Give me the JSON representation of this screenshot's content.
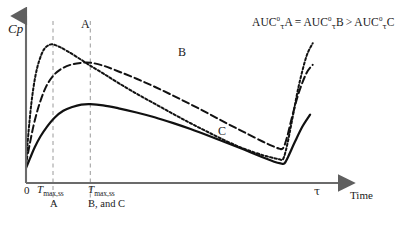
{
  "chart_data": {
    "type": "line",
    "title": "",
    "xlabel": "Time",
    "ylabel": "Cp",
    "xlim": [
      0,
      1.12
    ],
    "ylim": [
      0,
      1.0
    ],
    "grid": false,
    "legend_position": "inline-curve-labels",
    "xticks": [
      {
        "value": 0.0,
        "label": "0"
      },
      {
        "value": 0.105,
        "label": "Tmax,ss A"
      },
      {
        "value": 0.25,
        "label": "Tmax,ss B, and C"
      },
      {
        "value": 1.0,
        "label": "tau"
      }
    ],
    "annotations": [
      {
        "name": "auc-equation",
        "text": "AUC0τA = AUC0τB > AUC0τC"
      }
    ],
    "series": [
      {
        "name": "A",
        "label": "A",
        "style": "dotted",
        "color": "#111111",
        "tmax": 0.105,
        "cmax": 0.835,
        "x": [
          0.0,
          0.01,
          0.022,
          0.036,
          0.052,
          0.07,
          0.088,
          0.105,
          0.13,
          0.16,
          0.2,
          0.25,
          0.3,
          0.36,
          0.43,
          0.5,
          0.57,
          0.64,
          0.71,
          0.78,
          0.85,
          0.92,
          0.965,
          0.985,
          1.0,
          1.015,
          1.035,
          1.06,
          1.09,
          1.115
        ],
        "y": [
          0.115,
          0.31,
          0.495,
          0.64,
          0.74,
          0.805,
          0.83,
          0.835,
          0.82,
          0.795,
          0.757,
          0.707,
          0.66,
          0.602,
          0.538,
          0.478,
          0.418,
          0.36,
          0.305,
          0.252,
          0.205,
          0.168,
          0.15,
          0.143,
          0.145,
          0.225,
          0.38,
          0.58,
          0.76,
          0.842
        ]
      },
      {
        "name": "B",
        "label": "B",
        "style": "dashed",
        "color": "#111111",
        "tmax": 0.25,
        "cmax": 0.725,
        "x": [
          0.0,
          0.014,
          0.03,
          0.05,
          0.075,
          0.105,
          0.14,
          0.18,
          0.215,
          0.25,
          0.3,
          0.36,
          0.43,
          0.5,
          0.57,
          0.64,
          0.71,
          0.78,
          0.85,
          0.92,
          0.96,
          0.985,
          1.0,
          1.015,
          1.035,
          1.06,
          1.09,
          1.115
        ],
        "y": [
          0.118,
          0.23,
          0.35,
          0.465,
          0.57,
          0.645,
          0.69,
          0.715,
          0.724,
          0.725,
          0.707,
          0.672,
          0.628,
          0.58,
          0.528,
          0.474,
          0.418,
          0.36,
          0.305,
          0.25,
          0.222,
          0.207,
          0.21,
          0.275,
          0.4,
          0.54,
          0.66,
          0.712
        ]
      },
      {
        "name": "C",
        "label": "C",
        "style": "solid",
        "color": "#111111",
        "tmax": 0.25,
        "cmax": 0.475,
        "x": [
          0.0,
          0.016,
          0.034,
          0.056,
          0.082,
          0.112,
          0.145,
          0.18,
          0.215,
          0.25,
          0.3,
          0.36,
          0.43,
          0.5,
          0.57,
          0.64,
          0.71,
          0.78,
          0.85,
          0.92,
          0.965,
          0.99,
          1.005,
          1.02,
          1.045,
          1.075,
          1.105
        ],
        "y": [
          0.09,
          0.15,
          0.215,
          0.28,
          0.34,
          0.395,
          0.435,
          0.458,
          0.472,
          0.475,
          0.468,
          0.45,
          0.425,
          0.396,
          0.362,
          0.325,
          0.285,
          0.243,
          0.2,
          0.155,
          0.128,
          0.118,
          0.118,
          0.16,
          0.245,
          0.34,
          0.412
        ]
      }
    ],
    "guidelines": [
      {
        "name": "tmax-a-guide",
        "x": 0.105,
        "style": "dashed",
        "color": "#9a9a9a"
      },
      {
        "name": "tmax-bc-guide",
        "x": 0.25,
        "style": "dashed",
        "color": "#9a9a9a"
      }
    ]
  },
  "axes": {
    "ylabel": "Cp",
    "xlabel": "Time",
    "zero_label": "0",
    "tau_label": "τ",
    "axis_color": "#6b6b6b"
  },
  "tick_labels": {
    "tmax_a": {
      "main": "T",
      "sub": "max,ss",
      "line2": "A"
    },
    "tmax_bc": {
      "main": "T",
      "sub": "max,ss",
      "line2": "B, and C"
    }
  },
  "curve_labels": {
    "a": "A",
    "b": "B",
    "c": "C"
  },
  "auc_note": {
    "term1_base": "AUC",
    "term1_sup": "0",
    "term1_sub": "τ",
    "term1_tail": "A",
    "op1": "=",
    "term2_base": "AUC",
    "term2_sup": "0",
    "term2_sub": "τ",
    "term2_tail": "B",
    "op2": ">",
    "term3_base": "AUC",
    "term3_sup": "0",
    "term3_sub": "τ",
    "term3_tail": "C"
  }
}
